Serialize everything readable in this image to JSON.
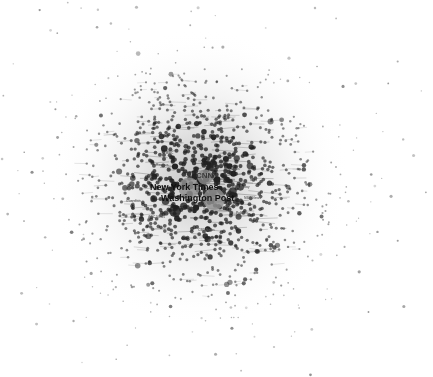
{
  "figure": {
    "title": "",
    "width": 433,
    "height": 377,
    "background_color": "#ffffff"
  },
  "chart_data": {
    "type": "scatter",
    "title": "",
    "xlabel": "",
    "ylabel": "",
    "subtitle": "",
    "grid": false,
    "legend": "none",
    "xlim": [
      0,
      433
    ],
    "ylim": [
      0,
      377
    ],
    "center": {
      "x": 200,
      "y": 184
    },
    "core_radius": 118,
    "halo_radius": 150,
    "node_count": 1050,
    "node_color": "#2b2b2b",
    "edge_color": "#6e6e6e",
    "haze_color": "#c8c8c8",
    "labeled_nodes": [
      {
        "label": "CNN",
        "x": 205,
        "y": 177,
        "r": 7.5,
        "fill": "#8a8a8a",
        "label_x": 196,
        "label_y": 172,
        "size": "secondary"
      },
      {
        "label": "New York Times",
        "x": 189,
        "y": 188,
        "r": 10.5,
        "fill": "#8f8f8f",
        "label_x": 150,
        "label_y": 183,
        "size": "primary"
      },
      {
        "label": "Washington Post",
        "x": 214,
        "y": 199,
        "r": 11.0,
        "fill": "#919191",
        "label_x": 161,
        "label_y": 194,
        "size": "primary"
      },
      {
        "label": "",
        "x": 175,
        "y": 211,
        "r": 6.0,
        "fill": "#1d1d1d",
        "label_x": 0,
        "label_y": 0,
        "size": "none"
      }
    ],
    "faint_labels": [
      {
        "text": "Fox News",
        "x": 224,
        "y": 168
      },
      {
        "text": "USA Today",
        "x": 232,
        "y": 186
      },
      {
        "text": "NBC News",
        "x": 244,
        "y": 197
      },
      {
        "text": "Reuters",
        "x": 156,
        "y": 164
      },
      {
        "text": "Guardian",
        "x": 126,
        "y": 200
      },
      {
        "text": "NPR",
        "x": 250,
        "y": 179
      },
      {
        "text": "ABC News",
        "x": 148,
        "y": 216
      },
      {
        "text": "Politico",
        "x": 236,
        "y": 212
      },
      {
        "text": "CBS News",
        "x": 198,
        "y": 229
      },
      {
        "text": "BBC",
        "x": 166,
        "y": 152
      }
    ]
  }
}
